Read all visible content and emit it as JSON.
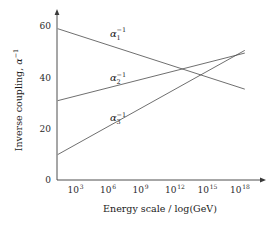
{
  "chart_data": {
    "type": "line",
    "title": "",
    "xlabel": "Energy scale / log(GeV)",
    "ylabel": "Inverse coupling, α⁻¹",
    "xlabel_parts": {
      "text": "Energy scale / log(GeV)"
    },
    "ylabel_parts": {
      "main": "Inverse coupling, ",
      "alpha": "α",
      "exponent": "−1"
    },
    "x_is_log": true,
    "x_tick_labels": [
      "10³",
      "10⁶",
      "10⁹",
      "10¹²",
      "10¹⁵",
      "10¹⁸"
    ],
    "x_tick_bases": [
      "10",
      "10",
      "10",
      "10",
      "10",
      "10"
    ],
    "x_tick_exponents": [
      "3",
      "6",
      "9",
      "12",
      "15",
      "18"
    ],
    "x_tick_exponent_values": [
      3,
      6,
      9,
      12,
      15,
      18
    ],
    "xlim_exponent": [
      1.5,
      19.5
    ],
    "y_tick_labels": [
      "0",
      "20",
      "40",
      "60"
    ],
    "y_tick_values": [
      0,
      20,
      40,
      60
    ],
    "ylim": [
      0,
      64
    ],
    "grid": false,
    "legend": "inline-annotations",
    "legend_position": "inline",
    "series": [
      {
        "name": "α₁⁻¹",
        "label_base": "α",
        "label_sub": "1",
        "label_sup": "−1",
        "color": "#4a4a4a",
        "x_exponents": [
          1.6,
          18.8
        ],
        "values": [
          59.0,
          35.5
        ],
        "annotation_x_exponent": 6.4,
        "annotation_y": 56.0
      },
      {
        "name": "α₂⁻¹",
        "label_base": "α",
        "label_sub": "2",
        "label_sup": "−1",
        "color": "#4a4a4a",
        "x_exponents": [
          1.6,
          18.8
        ],
        "values": [
          31.0,
          49.5
        ],
        "annotation_x_exponent": 6.4,
        "annotation_y": 38.5
      },
      {
        "name": "α₃⁻¹",
        "label_base": "α",
        "label_sub": "3",
        "label_sup": "−1",
        "color": "#4a4a4a",
        "x_exponents": [
          1.6,
          18.8
        ],
        "values": [
          10.0,
          50.5
        ],
        "annotation_x_exponent": 6.4,
        "annotation_y": 23.0
      }
    ]
  },
  "axes": {
    "x_arrow": true,
    "y_arrow": true
  }
}
